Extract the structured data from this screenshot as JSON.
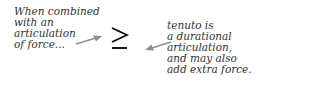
{
  "left_note": {
    "lines": [
      "When combined",
      "with an",
      "articulation",
      "of force..."
    ]
  },
  "right_note": {
    "lines": [
      "tenuto is",
      "a durational",
      "articulation,",
      "and may also",
      "add extra force."
    ]
  },
  "symbol": {
    "name": "accent-with-tenuto",
    "glyph": "≥"
  },
  "colors": {
    "text": "#333333",
    "arrow": "#8a8f96",
    "symbol": "#000000"
  }
}
